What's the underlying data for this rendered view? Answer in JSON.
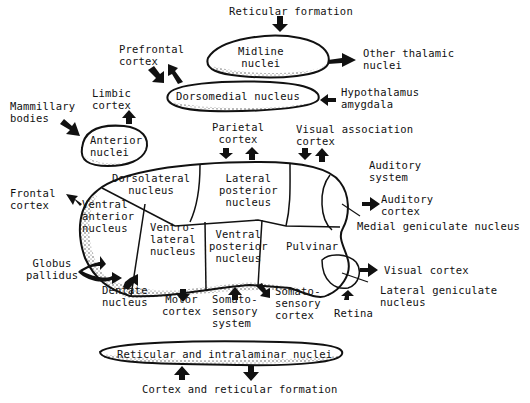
{
  "diagram": {
    "colors": {
      "ink": "#111111",
      "background": "#ffffff"
    },
    "nuclei": {
      "midline": "Midline\nnuclei",
      "dorsomedial": "Dorsomedial nucleus",
      "anterior": "Anterior\nnuclei",
      "dorsolateral": "Dorsolateral\nnucleus",
      "lateral_posterior": "Lateral\nposterior\nnucleus",
      "ventral_anterior": "Ventral\nanterior\nnucleus",
      "ventrolateral": "Ventro-\nlateral\nnucleus",
      "ventral_posterior": "Ventral\nposterior\nnucleus",
      "pulvinar": "Pulvinar",
      "reticular_intralaminar": "Reticular and intralaminar nuclei"
    },
    "connections": {
      "reticular_formation": "Reticular formation",
      "other_thalamic": "Other thalamic\nnuclei",
      "prefrontal": "Prefrontal\ncortex",
      "hypothalamus_amygdala": "Hypothalamus\namygdala",
      "limbic": "Limbic\ncortex",
      "mammillary": "Mammillary\nbodies",
      "parietal": "Parietal\ncortex",
      "visual_association": "Visual association\ncortex",
      "auditory_system": "Auditory\nsystem",
      "auditory_cortex": "Auditory\ncortex",
      "medial_geniculate": "Medial geniculate nucleus",
      "frontal": "Frontal\ncortex",
      "globus_pallidus": "Globus\npallidus",
      "dentate": "Dentate\nnucleus",
      "motor": "Motor\ncortex",
      "somatosensory_system": "Somato-\nsensory\nsystem",
      "somatosensory_cortex": "Somato-\nsensory\ncortex",
      "visual_cortex": "Visual cortex",
      "lateral_geniculate": "Lateral geniculate\nnucleus",
      "retina": "Retina",
      "cortex_reticular": "Cortex and reticular formation"
    }
  }
}
